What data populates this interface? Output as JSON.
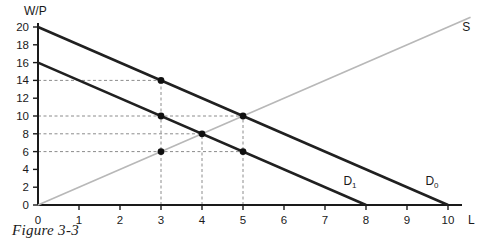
{
  "caption": "Figure 3-3",
  "chart_data": {
    "type": "line",
    "title": "",
    "subtitle": "",
    "xlabel": "L",
    "ylabel": "W/P",
    "xlim": [
      0,
      10
    ],
    "ylim": [
      0,
      20
    ],
    "xticks": [
      0,
      1,
      2,
      3,
      4,
      5,
      6,
      7,
      8,
      9,
      10
    ],
    "yticks": [
      0,
      2,
      4,
      6,
      8,
      10,
      12,
      14,
      16,
      18,
      20
    ],
    "xtick_labels": [
      "0",
      "1",
      "2",
      "3",
      "4",
      "5",
      "6",
      "7",
      "8",
      "9",
      "10"
    ],
    "ytick_labels": [
      "0",
      "2",
      "4",
      "6",
      "8",
      "10",
      "12",
      "14",
      "16",
      "18",
      "20"
    ],
    "grid": false,
    "legend": "inline-curve-labels",
    "series": [
      {
        "name": "D0",
        "label": "D",
        "label_sub": "0",
        "role": "demand",
        "color": "#202020",
        "width": 2.6,
        "x": [
          0,
          10
        ],
        "y": [
          20,
          0
        ],
        "slope": -2,
        "intercept": 20,
        "label_pos": [
          9.45,
          2.2
        ]
      },
      {
        "name": "D1",
        "label": "D",
        "label_sub": "1",
        "role": "demand",
        "color": "#202020",
        "width": 2.6,
        "x": [
          0,
          8
        ],
        "y": [
          16,
          0
        ],
        "slope": -2,
        "intercept": 16,
        "label_pos": [
          7.45,
          2.2
        ]
      },
      {
        "name": "S",
        "label": "S",
        "label_sub": "",
        "role": "supply",
        "color": "#b8b8b8",
        "width": 1.7,
        "x": [
          0,
          10.55
        ],
        "y": [
          0,
          21.1
        ],
        "slope": 2,
        "intercept": 0,
        "label_pos": [
          10.35,
          19.6
        ]
      }
    ],
    "points": [
      {
        "name": "point-3-14",
        "x": 3,
        "y": 14,
        "on": "D0"
      },
      {
        "name": "point-3-10",
        "x": 3,
        "y": 10,
        "on": "D1"
      },
      {
        "name": "point-3-6",
        "x": 3,
        "y": 6,
        "on": "S"
      },
      {
        "name": "point-4-8",
        "x": 4,
        "y": 8,
        "on": "D1-S-equilibrium"
      },
      {
        "name": "point-5-10",
        "x": 5,
        "y": 10,
        "on": "D0-S-equilibrium"
      },
      {
        "name": "point-5-6",
        "x": 5,
        "y": 6,
        "on": "D1"
      }
    ],
    "guide_lines": {
      "color": "#8c8c8c",
      "dash": "3,2.5",
      "horizontal": [
        {
          "name": "guide-y-14",
          "y": 14,
          "x_from": 0,
          "x_to": 3
        },
        {
          "name": "guide-y-10",
          "y": 10,
          "x_from": 0,
          "x_to": 5
        },
        {
          "name": "guide-y-8",
          "y": 8,
          "x_from": 0,
          "x_to": 4
        },
        {
          "name": "guide-y-6",
          "y": 6,
          "x_from": 0,
          "x_to": 5
        }
      ],
      "vertical": [
        {
          "name": "guide-x-3",
          "x": 3,
          "y_from": 0,
          "y_to": 14
        },
        {
          "name": "guide-x-4",
          "x": 4,
          "y_from": 0,
          "y_to": 8
        },
        {
          "name": "guide-x-5",
          "x": 5,
          "y_from": 0,
          "y_to": 10
        }
      ]
    }
  }
}
